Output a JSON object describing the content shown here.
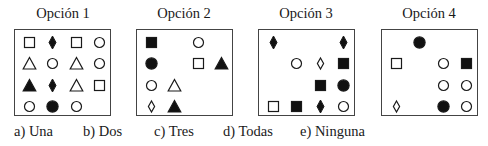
{
  "panels": [
    {
      "title": "Opción 1",
      "cells": [
        [
          "square-outline",
          "diamond-filled",
          "square-outline",
          "circle-outline"
        ],
        [
          "triangle-outline",
          "circle-outline",
          "triangle-outline",
          "circle-outline"
        ],
        [
          "triangle-filled",
          "diamond-filled",
          "triangle-outline",
          "square-outline"
        ],
        [
          "circle-outline",
          "circle-filled",
          "circle-outline",
          ""
        ]
      ]
    },
    {
      "title": "Opción 2",
      "cells": [
        [
          "square-filled",
          "",
          "circle-outline",
          ""
        ],
        [
          "circle-filled",
          "",
          "square-outline",
          "triangle-filled"
        ],
        [
          "circle-outline",
          "triangle-outline",
          "",
          ""
        ],
        [
          "diamond-outline",
          "triangle-filled",
          "",
          ""
        ]
      ]
    },
    {
      "title": "Opción 3",
      "cells": [
        [
          "diamond-filled",
          "",
          "",
          "diamond-filled"
        ],
        [
          "",
          "circle-outline",
          "diamond-outline",
          "square-filled"
        ],
        [
          "",
          "",
          "square-filled",
          "circle-filled"
        ],
        [
          "square-outline",
          "square-filled",
          "diamond-filled",
          "circle-outline"
        ]
      ]
    },
    {
      "title": "Opción 4",
      "cells": [
        [
          "",
          "circle-filled",
          "",
          ""
        ],
        [
          "square-outline",
          "",
          "circle-outline",
          "square-filled"
        ],
        [
          "",
          "",
          "circle-outline",
          "circle-outline"
        ],
        [
          "diamond-outline",
          "",
          "circle-filled",
          "circle-outline"
        ]
      ]
    }
  ],
  "answers": [
    {
      "label": "a) Una"
    },
    {
      "label": "b) Dos"
    },
    {
      "label": "c) Tres"
    },
    {
      "label": "d) Todas"
    },
    {
      "label": "e) Ninguna"
    }
  ],
  "colors": {
    "stroke": "#1a1a1a",
    "fill": "#111111",
    "border": "#444444"
  }
}
